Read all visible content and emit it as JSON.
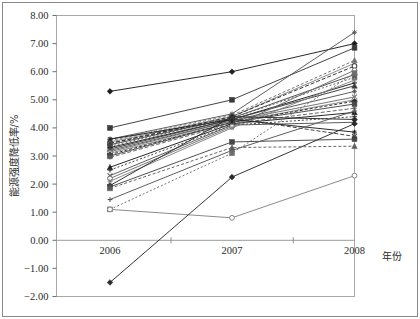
{
  "figure": {
    "outer_border_color": "#8a8a8a",
    "plot_border_color": "#a8a8a8",
    "background": "#ffffff"
  },
  "chart_data": {
    "type": "line",
    "title": "",
    "subtitle": "",
    "xlabel": "年份",
    "ylabel": "能源强度降低率/%",
    "x": [
      "2006",
      "2007",
      "2008"
    ],
    "categories": [
      "2006",
      "2007",
      "2008"
    ],
    "xlim": [
      "2006",
      "2008"
    ],
    "ylim": [
      -2.0,
      8.0
    ],
    "ytick_step": 1.0,
    "yticks": [
      8.0,
      7.0,
      6.0,
      5.0,
      4.0,
      3.0,
      2.0,
      1.0,
      0.0,
      -1.0,
      -2.0
    ],
    "ytick_labels": [
      "8.00",
      "7.00",
      "6.00",
      "5.00",
      "4.00",
      "3.00",
      "2.00",
      "1.00",
      "0.00",
      "-1.00",
      "-2.00"
    ],
    "xtick_labels": [
      "2006",
      "2007",
      "2008"
    ],
    "grid": false,
    "zero_line": true,
    "legend": "none",
    "legend_position": "none",
    "marker_cycle": [
      "diamond",
      "square",
      "triangle",
      "x",
      "star",
      "circle",
      "plus",
      "dash",
      "asterisk"
    ],
    "series": [
      {
        "name": "S01",
        "marker": "diamond",
        "values": [
          5.3,
          6.0,
          7.0
        ]
      },
      {
        "name": "S02",
        "marker": "square",
        "values": [
          4.0,
          5.0,
          6.85
        ]
      },
      {
        "name": "S03",
        "marker": "star",
        "values": [
          3.6,
          4.5,
          7.4
        ]
      },
      {
        "name": "S04",
        "marker": "triangle",
        "values": [
          3.55,
          4.45,
          6.4
        ]
      },
      {
        "name": "S05",
        "marker": "x",
        "values": [
          3.5,
          4.4,
          6.3
        ]
      },
      {
        "name": "S06",
        "marker": "circle",
        "values": [
          3.45,
          4.4,
          6.2
        ]
      },
      {
        "name": "S07",
        "marker": "diamond",
        "values": [
          3.4,
          4.35,
          5.9
        ]
      },
      {
        "name": "S08",
        "marker": "square",
        "values": [
          3.35,
          4.35,
          5.8
        ]
      },
      {
        "name": "S09",
        "marker": "plus",
        "values": [
          3.3,
          4.3,
          5.6
        ]
      },
      {
        "name": "S10",
        "marker": "triangle",
        "values": [
          3.25,
          4.3,
          5.5
        ]
      },
      {
        "name": "S11",
        "marker": "asterisk",
        "values": [
          3.2,
          4.25,
          5.3
        ]
      },
      {
        "name": "S12",
        "marker": "x",
        "values": [
          3.15,
          4.25,
          5.1
        ]
      },
      {
        "name": "S13",
        "marker": "circle",
        "values": [
          3.1,
          4.2,
          5.0
        ]
      },
      {
        "name": "S14",
        "marker": "diamond",
        "values": [
          3.05,
          4.2,
          4.95
        ]
      },
      {
        "name": "S15",
        "marker": "square",
        "values": [
          3.0,
          4.2,
          4.85
        ]
      },
      {
        "name": "S16",
        "marker": "star",
        "values": [
          2.95,
          4.15,
          4.7
        ]
      },
      {
        "name": "S17",
        "marker": "triangle",
        "values": [
          2.6,
          4.15,
          4.55
        ]
      },
      {
        "name": "S18",
        "marker": "plus",
        "values": [
          2.5,
          4.1,
          4.4
        ]
      },
      {
        "name": "S19",
        "marker": "x",
        "values": [
          2.3,
          4.1,
          4.2
        ]
      },
      {
        "name": "S20",
        "marker": "circle",
        "values": [
          2.2,
          4.05,
          6.05
        ]
      },
      {
        "name": "S21",
        "marker": "asterisk",
        "values": [
          2.1,
          4.0,
          5.7
        ]
      },
      {
        "name": "S22",
        "marker": "diamond",
        "values": [
          1.95,
          4.4,
          4.3
        ]
      },
      {
        "name": "S23",
        "marker": "square",
        "values": [
          1.9,
          3.5,
          3.6
        ]
      },
      {
        "name": "S24",
        "marker": "triangle",
        "values": [
          1.85,
          3.3,
          3.35
        ]
      },
      {
        "name": "S25",
        "marker": "star",
        "values": [
          3.6,
          4.3,
          3.85
        ]
      },
      {
        "name": "S26",
        "marker": "x",
        "values": [
          3.45,
          4.35,
          3.7
        ]
      },
      {
        "name": "S27",
        "marker": "plus",
        "values": [
          1.45,
          3.2,
          4.6
        ]
      },
      {
        "name": "S28",
        "marker": "square",
        "values": [
          1.1,
          3.1,
          5.95
        ]
      },
      {
        "name": "S29",
        "marker": "circle",
        "values": [
          1.1,
          0.8,
          2.3
        ]
      },
      {
        "name": "S30",
        "marker": "diamond",
        "values": [
          -1.5,
          2.25,
          4.15
        ]
      }
    ]
  },
  "accessibility": {
    "chart_role": "line-chart",
    "description": "Energy intensity reduction rate by year"
  }
}
